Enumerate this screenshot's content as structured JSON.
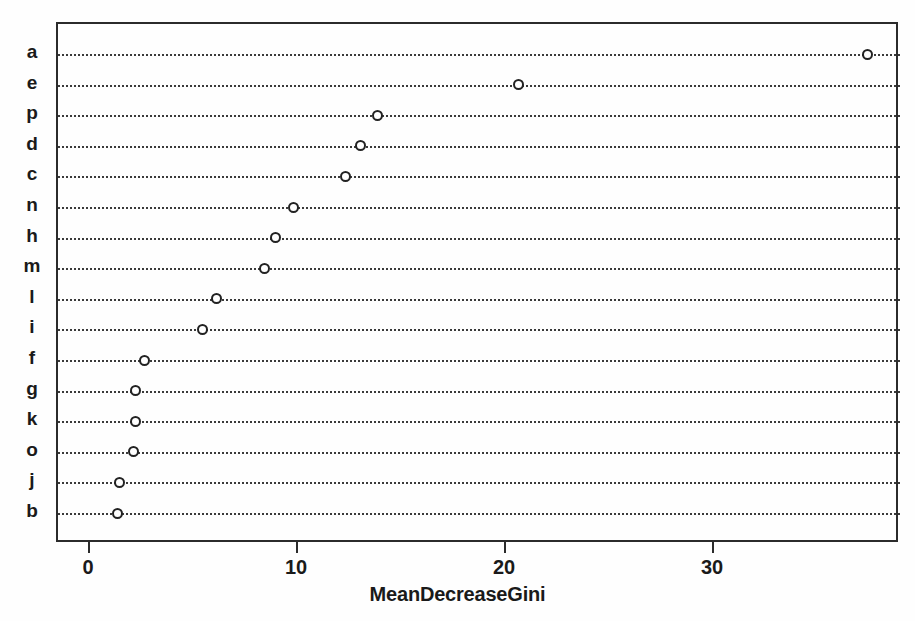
{
  "chart_data": {
    "type": "scatter",
    "title": "",
    "subtitle": "",
    "xlabel": "MeanDecreaseGini",
    "ylabel": "",
    "xlim": [
      -0.6,
      39.0
    ],
    "xticks": [
      0,
      10,
      20,
      30
    ],
    "xticklabels": [
      "0",
      "10",
      "20",
      "30"
    ],
    "grid": "horizontal-dotted",
    "legend": "none",
    "marker": "open-circle",
    "categories": [
      "a",
      "e",
      "p",
      "d",
      "c",
      "n",
      "h",
      "m",
      "l",
      "i",
      "f",
      "g",
      "k",
      "o",
      "j",
      "b"
    ],
    "values": [
      37.4,
      20.6,
      13.8,
      13.0,
      12.3,
      9.8,
      8.9,
      8.4,
      6.1,
      5.4,
      2.6,
      2.2,
      2.2,
      2.1,
      1.4,
      1.3
    ],
    "points": [
      {
        "label": "a",
        "value": 37.4
      },
      {
        "label": "e",
        "value": 20.6
      },
      {
        "label": "p",
        "value": 13.8
      },
      {
        "label": "d",
        "value": 13.0
      },
      {
        "label": "c",
        "value": 12.3
      },
      {
        "label": "n",
        "value": 9.8
      },
      {
        "label": "h",
        "value": 8.9
      },
      {
        "label": "m",
        "value": 8.4
      },
      {
        "label": "l",
        "value": 6.1
      },
      {
        "label": "i",
        "value": 5.4
      },
      {
        "label": "f",
        "value": 2.6
      },
      {
        "label": "g",
        "value": 2.2
      },
      {
        "label": "k",
        "value": 2.2
      },
      {
        "label": "o",
        "value": 2.1
      },
      {
        "label": "j",
        "value": 1.4
      },
      {
        "label": "b",
        "value": 1.3
      }
    ],
    "colors": {
      "marker_stroke": "#222222",
      "marker_fill": "#ffffff",
      "grid": "#3a3a3a",
      "frame": "#2b2b2b",
      "text": "#1a1a1a",
      "background": "#fefefe"
    }
  }
}
